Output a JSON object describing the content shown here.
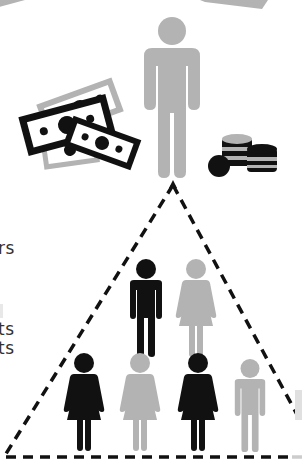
{
  "text_fragments": [
    {
      "text": "rs",
      "x": -2,
      "y": 240
    },
    {
      "text": "ts",
      "x": -2,
      "y": 321
    },
    {
      "text": "ts",
      "x": -2,
      "y": 340
    }
  ],
  "colors": {
    "black": "#111111",
    "grey": "#b3b3b3",
    "text": "#333333",
    "background": "#ffffff"
  },
  "top_figure": {
    "label": "wealthy-man",
    "color": "grey"
  },
  "money": {
    "bills": 4,
    "coin_stacks": 2,
    "loose_coins": 1
  },
  "pyramid": {
    "row1": [
      {
        "type": "man",
        "color": "black"
      },
      {
        "type": "woman",
        "color": "grey"
      }
    ],
    "row2": [
      {
        "type": "woman",
        "color": "black"
      },
      {
        "type": "woman",
        "color": "grey"
      },
      {
        "type": "woman",
        "color": "black"
      },
      {
        "type": "man",
        "color": "grey"
      }
    ]
  }
}
